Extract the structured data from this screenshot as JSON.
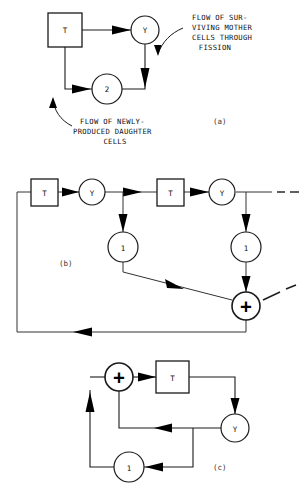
{
  "figure": {
    "panels": [
      {
        "id": "a",
        "caption": "(a)",
        "nodes": [
          {
            "name": "transit-box",
            "label": "T",
            "shape": "square",
            "cx": 65,
            "cy": 30
          },
          {
            "name": "yield-circle",
            "label": "Y",
            "shape": "circle",
            "cx": 145,
            "cy": 30
          },
          {
            "name": "gain-two-circle",
            "label": "2",
            "shape": "circle",
            "cx": 107,
            "cy": 89
          }
        ],
        "annotations": [
          {
            "name": "surviving-mother-cells-note",
            "lines": [
              "FLOW OF SUR-",
              "VIVING MOTHER",
              "CELLS THROUGH",
              "FISSION"
            ]
          },
          {
            "name": "newly-produced-daughter-cells-note",
            "lines": [
              "FLOW OF NEWLY-",
              "PRODUCED DAUGHTER",
              "CELLS"
            ]
          }
        ]
      },
      {
        "id": "b",
        "caption": "(b)",
        "nodes": [
          {
            "name": "transit-box-1",
            "label": "T",
            "shape": "square",
            "cx": 44,
            "cy": 192
          },
          {
            "name": "yield-circle-1",
            "label": "Y",
            "shape": "circle",
            "cx": 92,
            "cy": 192
          },
          {
            "name": "transit-box-2",
            "label": "T",
            "shape": "square",
            "cx": 170,
            "cy": 192
          },
          {
            "name": "yield-circle-2",
            "label": "Y",
            "shape": "circle",
            "cx": 222,
            "cy": 192
          },
          {
            "name": "unity-circle-1",
            "label": "1",
            "shape": "circle",
            "cx": 123,
            "cy": 247
          },
          {
            "name": "unity-circle-2",
            "label": "1",
            "shape": "circle",
            "cx": 246,
            "cy": 247
          },
          {
            "name": "summing-junction",
            "label": "+",
            "shape": "circle",
            "cx": 246,
            "cy": 306
          }
        ]
      },
      {
        "id": "c",
        "caption": "(c)",
        "nodes": [
          {
            "name": "summing-junction",
            "label": "+",
            "shape": "circle",
            "cx": 119,
            "cy": 377
          },
          {
            "name": "transit-box",
            "label": "T",
            "shape": "square",
            "cx": 172,
            "cy": 377
          },
          {
            "name": "yield-circle",
            "label": "Y",
            "shape": "circle",
            "cx": 235,
            "cy": 428
          },
          {
            "name": "unity-circle",
            "label": "1",
            "shape": "circle",
            "cx": 129,
            "cy": 467
          }
        ]
      }
    ]
  },
  "colors": {
    "ink": "#1a1a1a",
    "background": "#ffffff",
    "arrow": "#000000"
  }
}
